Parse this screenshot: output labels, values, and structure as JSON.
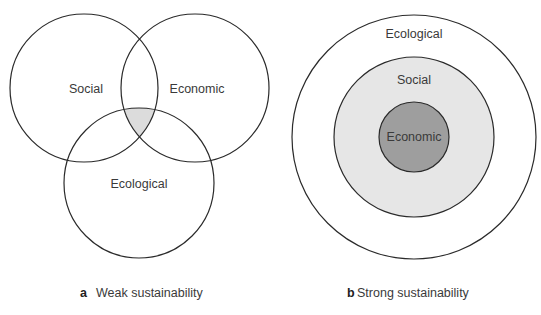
{
  "panel_a": {
    "letter": "a",
    "caption": "Weak sustainability",
    "circles": [
      {
        "label": "Social",
        "cx": 84,
        "cy": 88,
        "r": 74
      },
      {
        "label": "Economic",
        "cx": 195,
        "cy": 88,
        "r": 74
      },
      {
        "label": "Ecological",
        "cx": 139,
        "cy": 183,
        "r": 75
      }
    ],
    "overlap_fill": "#dcdcdc"
  },
  "panel_b": {
    "letter": "b",
    "caption": "Strong sustainability",
    "rings": [
      {
        "label": "Ecological",
        "r": 122,
        "fill": "#ffffff"
      },
      {
        "label": "Social",
        "r": 80,
        "fill": "#e6e6e6"
      },
      {
        "label": "Economic",
        "r": 35,
        "fill": "#9e9e9e"
      }
    ],
    "cx": 414,
    "cy": 137
  },
  "colors": {
    "stroke": "#2a2a2a",
    "text": "#3a3a3a"
  }
}
